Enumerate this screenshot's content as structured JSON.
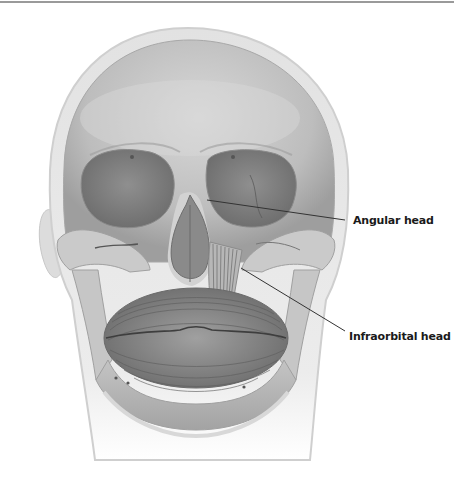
{
  "figure": {
    "labels": [
      {
        "id": "angular-head",
        "text": "Angular head",
        "x": 353,
        "y": 214,
        "line": {
          "x1": 207,
          "y1": 200,
          "x2": 345,
          "y2": 220
        }
      },
      {
        "id": "infraorbital-head",
        "text": "Infraorbital head",
        "x": 349,
        "y": 330,
        "line": {
          "x1": 241,
          "y1": 268,
          "x2": 345,
          "y2": 331
        }
      }
    ]
  },
  "colors": {
    "background": "#ffffff",
    "head_outline": "#d8d8d8",
    "skull_light": "#cfcfcf",
    "skull_mid": "#a9a9a9",
    "orbit_dark": "#7a7a7a",
    "muscle": "#8e8e8e",
    "leader_line": "#333333",
    "label_text": "#1a1a1a"
  }
}
